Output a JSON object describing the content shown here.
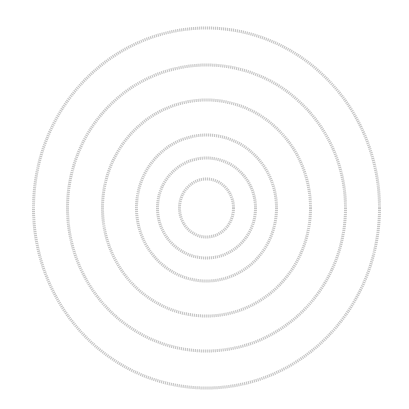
{
  "figure": {
    "background": "#ffffff",
    "stroke_color": "#c6c6c6",
    "stroke_width": 3,
    "center": {
      "cx": 206.5,
      "cy": 208
    },
    "rings": [
      {
        "rx": 173,
        "ry": 180
      },
      {
        "rx": 139,
        "ry": 143
      },
      {
        "rx": 104,
        "ry": 108
      },
      {
        "rx": 70,
        "ry": 73
      },
      {
        "rx": 49,
        "ry": 50
      },
      {
        "rx": 27,
        "ry": 29
      }
    ]
  }
}
